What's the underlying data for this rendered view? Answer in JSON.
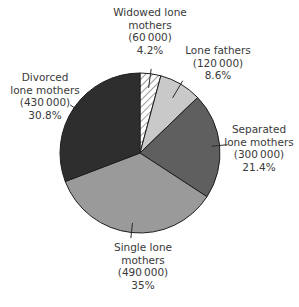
{
  "chart_data": {
    "type": "pie",
    "title": "",
    "start_angle_deg": 0,
    "direction": "clockwise",
    "slices": [
      {
        "key": "widowed",
        "label_lines": [
          "Widowed lone",
          "mothers"
        ],
        "count": "(60 000)",
        "value": 60000,
        "percent": "4.2%",
        "pct": 4.2,
        "fill": "#ffffff",
        "hatched": true
      },
      {
        "key": "fathers",
        "label_lines": [
          "Lone fathers"
        ],
        "count": "(120 000)",
        "value": 120000,
        "percent": "8.6%",
        "pct": 8.6,
        "fill": "#c9c9c9",
        "hatched": false
      },
      {
        "key": "separated",
        "label_lines": [
          "Separated",
          "lone mothers"
        ],
        "count": "(300 000)",
        "value": 300000,
        "percent": "21.4%",
        "pct": 21.4,
        "fill": "#5f5f5f",
        "hatched": false
      },
      {
        "key": "single",
        "label_lines": [
          "Single lone",
          "mothers"
        ],
        "count": "(490 000)",
        "value": 490000,
        "percent": "35%",
        "pct": 35.0,
        "fill": "#9a9a9a",
        "hatched": false
      },
      {
        "key": "divorced",
        "label_lines": [
          "Divorced",
          "lone mothers"
        ],
        "count": "(430 000)",
        "value": 430000,
        "percent": "30.8%",
        "pct": 30.8,
        "fill": "#2e2e2e",
        "hatched": false
      }
    ],
    "legend": "none (direct labels with leader lines)"
  },
  "labels": {
    "widowed": {
      "line1": "Widowed lone",
      "line2": "mothers",
      "count": "(60 000)",
      "percent": "4.2%"
    },
    "fathers": {
      "line1": "Lone fathers",
      "count": "(120 000)",
      "percent": "8.6%"
    },
    "separated": {
      "line1": "Separated",
      "line2": "lone mothers",
      "count": "(300 000)",
      "percent": "21.4%"
    },
    "single": {
      "line1": "Single lone",
      "line2": "mothers",
      "count": "(490 000)",
      "percent": "35%"
    },
    "divorced": {
      "line1": "Divorced",
      "line2": "lone mothers",
      "count": "(430 000)",
      "percent": "30.8%"
    }
  },
  "colors": {
    "outline": "#1e1e1e",
    "hatch": "#3a3a3a",
    "text": "#3a3a3a"
  }
}
